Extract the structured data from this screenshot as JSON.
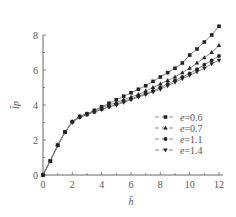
{
  "chart_data": {
    "type": "line",
    "title": "",
    "xlabel": "h̄",
    "ylabel": "l̄p",
    "xlim": [
      0,
      12
    ],
    "ylim": [
      0,
      8
    ],
    "xticks": [
      0,
      2,
      4,
      6,
      8,
      10,
      12
    ],
    "yticks": [
      0,
      2,
      4,
      6,
      8
    ],
    "grid": false,
    "legend_position": "lower right (inside)",
    "x": [
      0,
      0.5,
      1,
      1.5,
      2,
      2.5,
      3,
      3.5,
      4,
      4.5,
      5,
      5.5,
      6,
      6.5,
      7,
      7.5,
      8,
      8.5,
      9,
      9.5,
      10,
      10.5,
      11,
      11.5,
      12
    ],
    "series": [
      {
        "name": "e=0.6",
        "marker": "square",
        "values": [
          0,
          0.8,
          1.7,
          2.45,
          3.05,
          3.35,
          3.5,
          3.7,
          3.9,
          4.1,
          4.3,
          4.5,
          4.7,
          4.9,
          5.1,
          5.35,
          5.6,
          5.85,
          6.1,
          6.4,
          6.85,
          7.2,
          7.6,
          8.0,
          8.5
        ]
      },
      {
        "name": "e=0.7",
        "marker": "triangle-up",
        "values": [
          0,
          0.8,
          1.7,
          2.45,
          3.05,
          3.35,
          3.5,
          3.65,
          3.85,
          4.0,
          4.15,
          4.3,
          4.45,
          4.6,
          4.8,
          5.0,
          5.2,
          5.4,
          5.6,
          5.85,
          6.1,
          6.4,
          6.7,
          7.0,
          7.4
        ]
      },
      {
        "name": "e=1.1",
        "marker": "circle",
        "values": [
          0,
          0.8,
          1.7,
          2.45,
          3.05,
          3.3,
          3.45,
          3.6,
          3.75,
          3.9,
          4.05,
          4.2,
          4.35,
          4.5,
          4.65,
          4.8,
          5.0,
          5.2,
          5.4,
          5.6,
          5.8,
          6.05,
          6.3,
          6.55,
          6.8
        ]
      },
      {
        "name": "e=1.4",
        "marker": "triangle-down",
        "values": [
          0,
          0.8,
          1.7,
          2.45,
          3.0,
          3.3,
          3.45,
          3.6,
          3.75,
          3.9,
          4.0,
          4.15,
          4.3,
          4.45,
          4.6,
          4.75,
          4.9,
          5.1,
          5.3,
          5.5,
          5.7,
          5.9,
          6.1,
          6.35,
          6.55
        ]
      }
    ]
  },
  "labels": {
    "x_axis": "h̄",
    "y_axis": "l̄p"
  },
  "legend": [
    {
      "label": "e=0.6",
      "marker": "square"
    },
    {
      "label": "e=0.7",
      "marker": "triangle-up"
    },
    {
      "label": "e=1.1",
      "marker": "circle"
    },
    {
      "label": "e=1.4",
      "marker": "triangle-down"
    }
  ],
  "style": {
    "line_color": "#7a7a7a",
    "marker_color": "#222222",
    "axis_color": "#666666"
  }
}
